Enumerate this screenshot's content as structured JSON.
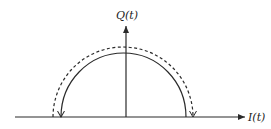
{
  "diagram": {
    "type": "IQ constellation trajectory",
    "axes": {
      "horizontal_label": "I(t)",
      "vertical_label": "Q(t)"
    },
    "curves": [
      {
        "name": "solid-trajectory",
        "style": "solid",
        "direction": "counterclockwise from +I to -I",
        "arrow_end": "left"
      },
      {
        "name": "dashed-trajectory",
        "style": "dashed",
        "direction": "clockwise from -I to +I",
        "arrow_end": "right"
      }
    ],
    "colors": {
      "line": "#2a2a2a",
      "background": "#ffffff"
    }
  }
}
